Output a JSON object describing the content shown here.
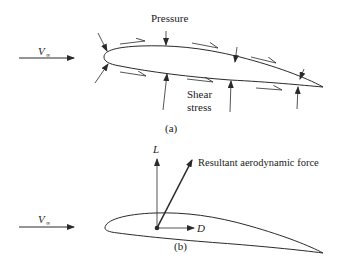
{
  "figure_a": {
    "caption": "(a)",
    "freestream_label": "V",
    "freestream_subscript": "∞",
    "pressure_label": "Pressure",
    "shear_label_line1": "Shear",
    "shear_label_line2": "stress"
  },
  "figure_b": {
    "caption": "(b)",
    "freestream_label": "V",
    "freestream_subscript": "∞",
    "lift_label": "L",
    "drag_label": "D",
    "resultant_label": "Resultant aerodynamic force"
  },
  "colors": {
    "line": "#2a2a2a",
    "background": "#ffffff"
  }
}
